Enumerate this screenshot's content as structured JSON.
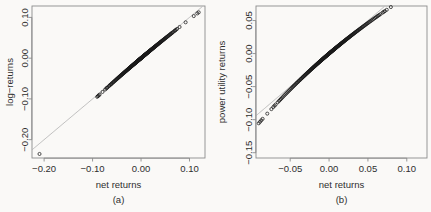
{
  "figure": {
    "background": "#faf9f7",
    "point_color": "#1a1a1a",
    "reference_line_color": "#b3b3b3",
    "axis_color": "#8c8c8c"
  },
  "chart_data": [
    {
      "type": "scatter",
      "panel": "a",
      "caption": "(a)",
      "title": "",
      "xlabel": "net returns",
      "ylabel": "log−returns",
      "xlim": [
        -0.225,
        0.132
      ],
      "ylim": [
        -0.245,
        0.128
      ],
      "xticks": [
        -0.2,
        -0.1,
        0.0,
        0.1
      ],
      "xtick_labels": [
        "−0.20",
        "−0.10",
        "0.00",
        "0.10"
      ],
      "yticks": [
        0.1,
        0.0,
        -0.1,
        -0.2
      ],
      "ytick_labels": [
        "0.10",
        "0.00",
        "−0.10",
        "−0.20"
      ],
      "grid": false,
      "legend": "none",
      "reference_line": {
        "type": "identity",
        "x": [
          -0.225,
          0.132
        ],
        "y": [
          -0.225,
          0.132
        ]
      },
      "relation": "y = log(1 + x)",
      "n_points": 520,
      "x": [
        -0.2095,
        -0.0905,
        -0.0888,
        -0.0872,
        -0.0855,
        -0.0795,
        -0.0742,
        -0.0718,
        -0.0702,
        -0.0688,
        -0.0661,
        -0.0644,
        -0.063,
        -0.0618,
        -0.0604,
        -0.059,
        -0.0575,
        -0.0561,
        -0.0548,
        -0.0535,
        -0.0522,
        -0.051,
        -0.0498,
        -0.0487,
        -0.0476,
        -0.0465,
        -0.0454,
        -0.0444,
        -0.0434,
        -0.0424,
        -0.0414,
        -0.0405,
        -0.0396,
        -0.0387,
        -0.0378,
        -0.037,
        -0.0361,
        -0.0353,
        -0.0345,
        -0.0337,
        -0.033,
        -0.0322,
        -0.0315,
        -0.0308,
        -0.0301,
        -0.0294,
        -0.0287,
        -0.028,
        -0.0274,
        -0.0267,
        -0.0261,
        -0.0255,
        -0.0249,
        -0.0243,
        -0.0237,
        -0.0231,
        -0.0226,
        -0.022,
        -0.0215,
        -0.0209,
        -0.0204,
        -0.0199,
        -0.0194,
        -0.0189,
        -0.0184,
        -0.0179,
        -0.0174,
        -0.017,
        -0.0165,
        -0.0161,
        -0.0156,
        -0.0152,
        -0.0147,
        -0.0143,
        -0.0139,
        -0.0135,
        -0.0131,
        -0.0127,
        -0.0123,
        -0.0119,
        -0.0115,
        -0.0111,
        -0.0108,
        -0.0104,
        -0.01,
        -0.0097,
        -0.0093,
        -0.009,
        -0.0086,
        -0.0083,
        -0.008,
        -0.0076,
        -0.0073,
        -0.007,
        -0.0067,
        -0.0064,
        -0.0061,
        -0.0058,
        -0.0055,
        -0.0052,
        -0.0049,
        -0.0046,
        -0.0043,
        -0.004,
        -0.0037,
        -0.0035,
        -0.0032,
        -0.0029,
        -0.0027,
        -0.0024,
        -0.0021,
        -0.0019,
        -0.0016,
        -0.0014,
        -0.0011,
        -0.0009,
        -0.0006,
        -0.0004,
        -0.0001,
        0.0001,
        0.0004,
        0.0006,
        0.0009,
        0.0011,
        0.0014,
        0.0016,
        0.0019,
        0.0021,
        0.0024,
        0.0027,
        0.0029,
        0.0032,
        0.0035,
        0.0037,
        0.004,
        0.0043,
        0.0046,
        0.0049,
        0.0052,
        0.0055,
        0.0058,
        0.0061,
        0.0064,
        0.0067,
        0.007,
        0.0073,
        0.0076,
        0.008,
        0.0083,
        0.0086,
        0.009,
        0.0093,
        0.0097,
        0.01,
        0.0104,
        0.0108,
        0.0111,
        0.0115,
        0.0119,
        0.0123,
        0.0127,
        0.0131,
        0.0135,
        0.0139,
        0.0143,
        0.0147,
        0.0152,
        0.0156,
        0.0161,
        0.0165,
        0.017,
        0.0174,
        0.0179,
        0.0184,
        0.0189,
        0.0194,
        0.0199,
        0.0204,
        0.0209,
        0.0215,
        0.022,
        0.0226,
        0.0231,
        0.0237,
        0.0243,
        0.0249,
        0.0255,
        0.0261,
        0.0267,
        0.0274,
        0.028,
        0.0287,
        0.0294,
        0.0301,
        0.0308,
        0.0315,
        0.0322,
        0.033,
        0.0337,
        0.0345,
        0.0353,
        0.0361,
        0.037,
        0.0378,
        0.0387,
        0.0396,
        0.0405,
        0.0414,
        0.0424,
        0.0434,
        0.0444,
        0.0454,
        0.0465,
        0.0476,
        0.0487,
        0.0498,
        0.051,
        0.0522,
        0.0535,
        0.0548,
        0.0561,
        0.0575,
        0.059,
        0.0604,
        0.0618,
        0.063,
        0.0644,
        0.0661,
        0.0688,
        0.0702,
        0.0718,
        0.0742,
        0.0795,
        0.092,
        0.1088,
        0.116,
        0.119
      ]
    },
    {
      "type": "scatter",
      "panel": "b",
      "caption": "(b)",
      "title": "",
      "xlabel": "net returns",
      "ylabel": "power utility returns",
      "xlim": [
        -0.094,
        0.126
      ],
      "ylim": [
        -0.158,
        0.072
      ],
      "xticks": [
        -0.05,
        0.0,
        0.05,
        0.1
      ],
      "xtick_labels": [
        "−0.05",
        "0.00",
        "0.05",
        "0.10"
      ],
      "yticks": [
        0.05,
        0.0,
        -0.05,
        -0.1,
        -0.15
      ],
      "ytick_labels": [
        "0.05",
        "0.00",
        "−0.05",
        "−0.10",
        "−0.15"
      ],
      "grid": false,
      "legend": "none",
      "reference_line": {
        "type": "identity",
        "x": [
          -0.094,
          0.126
        ],
        "y": [
          -0.094,
          0.126
        ]
      },
      "relation": "y = ((1 + x)^(1-gamma) - 1)/(1-gamma), concave",
      "n_points": 520,
      "x": [
        -0.0905,
        -0.0888,
        -0.0872,
        -0.0855,
        -0.0795,
        -0.0742,
        -0.0718,
        -0.0702,
        -0.0688,
        -0.0661,
        -0.0644,
        -0.063,
        -0.0618,
        -0.0604,
        -0.059,
        -0.0575,
        -0.0561,
        -0.0548,
        -0.0535,
        -0.0522,
        -0.051,
        -0.0498,
        -0.0487,
        -0.0476,
        -0.0465,
        -0.0454,
        -0.0444,
        -0.0434,
        -0.0424,
        -0.0414,
        -0.0405,
        -0.0396,
        -0.0387,
        -0.0378,
        -0.037,
        -0.0361,
        -0.0353,
        -0.0345,
        -0.0337,
        -0.033,
        -0.0322,
        -0.0315,
        -0.0308,
        -0.0301,
        -0.0294,
        -0.0287,
        -0.028,
        -0.0274,
        -0.0267,
        -0.0261,
        -0.0255,
        -0.0249,
        -0.0243,
        -0.0237,
        -0.0231,
        -0.0226,
        -0.022,
        -0.0215,
        -0.0209,
        -0.0204,
        -0.0199,
        -0.0194,
        -0.0189,
        -0.0184,
        -0.0179,
        -0.0174,
        -0.017,
        -0.0165,
        -0.0161,
        -0.0156,
        -0.0152,
        -0.0147,
        -0.0143,
        -0.0139,
        -0.0135,
        -0.0131,
        -0.0127,
        -0.0123,
        -0.0119,
        -0.0115,
        -0.0111,
        -0.0108,
        -0.0104,
        -0.01,
        -0.0097,
        -0.0093,
        -0.009,
        -0.0086,
        -0.0083,
        -0.008,
        -0.0076,
        -0.0073,
        -0.007,
        -0.0067,
        -0.0064,
        -0.0061,
        -0.0058,
        -0.0055,
        -0.0052,
        -0.0049,
        -0.0046,
        -0.0043,
        -0.004,
        -0.0037,
        -0.0035,
        -0.0032,
        -0.0029,
        -0.0027,
        -0.0024,
        -0.0021,
        -0.0019,
        -0.0016,
        -0.0014,
        -0.0011,
        -0.0009,
        -0.0006,
        -0.0004,
        -0.0001,
        0.0001,
        0.0004,
        0.0006,
        0.0009,
        0.0011,
        0.0014,
        0.0016,
        0.0019,
        0.0021,
        0.0024,
        0.0027,
        0.0029,
        0.0032,
        0.0035,
        0.0037,
        0.004,
        0.0043,
        0.0046,
        0.0049,
        0.0052,
        0.0055,
        0.0058,
        0.0061,
        0.0064,
        0.0067,
        0.007,
        0.0073,
        0.0076,
        0.008,
        0.0083,
        0.0086,
        0.009,
        0.0093,
        0.0097,
        0.01,
        0.0104,
        0.0108,
        0.0111,
        0.0115,
        0.0119,
        0.0123,
        0.0127,
        0.0131,
        0.0135,
        0.0139,
        0.0143,
        0.0147,
        0.0152,
        0.0156,
        0.0161,
        0.0165,
        0.017,
        0.0174,
        0.0179,
        0.0184,
        0.0189,
        0.0194,
        0.0199,
        0.0204,
        0.0209,
        0.0215,
        0.022,
        0.0226,
        0.0231,
        0.0237,
        0.0243,
        0.0249,
        0.0255,
        0.0261,
        0.0267,
        0.0274,
        0.028,
        0.0287,
        0.0294,
        0.0301,
        0.0308,
        0.0315,
        0.0322,
        0.033,
        0.0337,
        0.0345,
        0.0353,
        0.0361,
        0.037,
        0.0378,
        0.0387,
        0.0396,
        0.0405,
        0.0414,
        0.0424,
        0.0434,
        0.0444,
        0.0454,
        0.0465,
        0.0476,
        0.0487,
        0.0498,
        0.051,
        0.0522,
        0.0535,
        0.0548,
        0.0561,
        0.0575,
        0.059,
        0.0604,
        0.0618,
        0.063,
        0.0644,
        0.0661,
        0.0688,
        0.0702,
        0.0718,
        0.0742,
        0.0795,
        0.092,
        0.1088,
        0.116,
        0.119
      ]
    }
  ]
}
